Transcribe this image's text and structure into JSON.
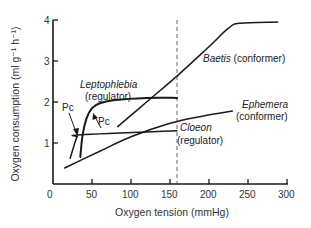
{
  "chart_data": {
    "type": "line",
    "title": "",
    "xlabel": "Oxygen tension (mmHg)",
    "ylabel": "Oxygen consumption (ml g⁻¹ h⁻¹)",
    "xlim": [
      0,
      300
    ],
    "ylim": [
      0,
      4
    ],
    "x_ticks": [
      0,
      50,
      100,
      150,
      200,
      250,
      300
    ],
    "y_ticks": [
      1,
      2,
      3,
      4
    ],
    "grid": false,
    "legend": "none (inline labels)",
    "reference_line": {
      "orientation": "vertical",
      "x": 159,
      "style": "dashed"
    },
    "series": [
      {
        "name": "Baetis",
        "label": "Baetis",
        "note": "(conformer)",
        "points": [
          [
            83,
            1.4
          ],
          [
            120,
            2.0
          ],
          [
            160,
            2.65
          ],
          [
            200,
            3.35
          ],
          [
            225,
            3.8
          ],
          [
            240,
            3.92
          ],
          [
            288,
            3.95
          ]
        ]
      },
      {
        "name": "Leptophlebia",
        "label": "Leptophlebia",
        "note": "(regulator)",
        "points": [
          [
            35,
            0.66
          ],
          [
            38,
            1.2
          ],
          [
            43,
            1.6
          ],
          [
            50,
            1.85
          ],
          [
            60,
            1.97
          ],
          [
            80,
            2.05
          ],
          [
            120,
            2.1
          ],
          [
            159,
            2.1
          ]
        ]
      },
      {
        "name": "Cloeon",
        "label": "Cloeon",
        "note": "(regulator)",
        "points": [
          [
            22,
            0.63
          ],
          [
            28,
            1.0
          ],
          [
            31,
            1.15
          ],
          [
            36,
            1.2
          ],
          [
            159,
            1.3
          ]
        ]
      },
      {
        "name": "Ephemera",
        "label": "Ephemera",
        "note": "(conformer)",
        "points": [
          [
            15,
            0.39
          ],
          [
            60,
            0.8
          ],
          [
            100,
            1.15
          ],
          [
            150,
            1.48
          ],
          [
            190,
            1.65
          ],
          [
            230,
            1.78
          ]
        ]
      }
    ],
    "annotations": [
      {
        "text": "Pc",
        "target": "Cloeon",
        "at": [
          31,
          1.15
        ]
      },
      {
        "text": "Pc",
        "target": "Leptophlebia",
        "at": [
          43,
          1.6
        ]
      }
    ]
  },
  "labels": {
    "y_axis": "Oxygen consumption (ml g⁻¹ h⁻¹)",
    "x_axis": "Oxygen tension (mmHg)",
    "origin": "0",
    "x_ticks": [
      "50",
      "100",
      "150",
      "200",
      "250",
      "300"
    ],
    "y_ticks": [
      "1",
      "2",
      "3",
      "4"
    ],
    "baetis_name": "Baetis",
    "baetis_note": " (conformer)",
    "lepto_name": "Leptophlebia",
    "lepto_note": "(regulator)",
    "cloeon_name": "Cloeon",
    "cloeon_note": "(regulator)",
    "ephemera_name": "Ephemera",
    "ephemera_note": "(conformer)",
    "pc1": "Pc",
    "pc2": "Pc"
  }
}
